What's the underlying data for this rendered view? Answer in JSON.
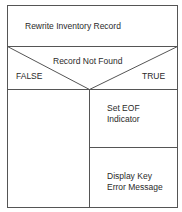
{
  "diagram": {
    "type": "Nassi-Shneiderman structured flowchart",
    "process": {
      "label": "Rewrite Inventory Record"
    },
    "decision": {
      "condition": "Record Not Found",
      "false_label": "FALSE",
      "true_label": "TRUE"
    },
    "false_branch": {
      "steps": []
    },
    "true_branch": {
      "steps": [
        {
          "line1": "Set EOF",
          "line2": "Indicator"
        },
        {
          "line1": "Display Key",
          "line2": "Error Message"
        }
      ]
    },
    "colors": {
      "line": "#555555",
      "text": "#2a2a2a",
      "background": "#ffffff"
    }
  }
}
